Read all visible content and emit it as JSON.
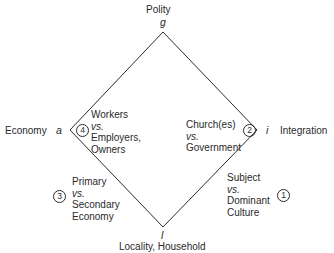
{
  "diagram": {
    "type": "AGIL diamond",
    "line_color": "#2a2a2a",
    "vertices": {
      "top": {
        "letter": "g",
        "label": "Polity"
      },
      "left": {
        "letter": "a",
        "label": "Economy"
      },
      "right": {
        "letter": "i",
        "label": "Integration"
      },
      "bottom": {
        "letter": "l",
        "label": "Locality, Household"
      }
    },
    "edges": [
      {
        "number": "1",
        "position": "bottom-right",
        "lines": [
          "Subject",
          "vs.",
          "Dominant",
          "Culture"
        ]
      },
      {
        "number": "2",
        "position": "top-right",
        "lines": [
          "Church(es)",
          "vs.",
          "Government"
        ]
      },
      {
        "number": "3",
        "position": "bottom-left",
        "lines": [
          "Primary",
          "vs.",
          "Secondary",
          "Economy"
        ]
      },
      {
        "number": "4",
        "position": "top-left",
        "lines": [
          "Workers",
          "vs.",
          "Employers,",
          "Owners"
        ]
      }
    ]
  }
}
